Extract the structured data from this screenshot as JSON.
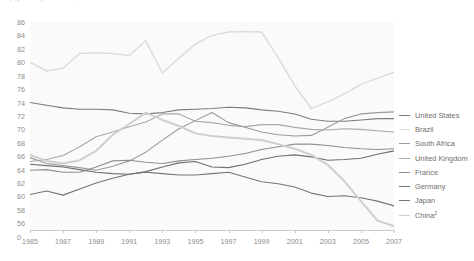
{
  "title": "Employment/Population ratio, 1985 to 2007",
  "chart_data": {
    "type": "line",
    "title": "Employment/Population ratio, 1985 to 2007",
    "xlabel": "",
    "ylabel": "",
    "x": [
      1985,
      1986,
      1987,
      1988,
      1989,
      1990,
      1991,
      1992,
      1993,
      1994,
      1995,
      1996,
      1997,
      1998,
      1999,
      2000,
      2001,
      2002,
      2003,
      2004,
      2005,
      2006,
      2007
    ],
    "xtick_labels": [
      "1985",
      "1987",
      "1989",
      "1991",
      "1993",
      "1995",
      "1997",
      "1999",
      "2001",
      "2003",
      "2005",
      "2007"
    ],
    "ytick_labels": [
      "86",
      "84",
      "82",
      "80",
      "78",
      "76",
      "74",
      "72",
      "70",
      "68",
      "66",
      "64",
      "62",
      "60",
      "58",
      "56"
    ],
    "axis_break_label": "0",
    "ylim": [
      55,
      86
    ],
    "xlim": [
      1985,
      2007
    ],
    "grid": false,
    "legend_position": "right",
    "series": [
      {
        "name": "United States",
        "color": "#7d7d7d",
        "width": 1.1,
        "values": [
          74.0,
          73.6,
          73.2,
          73.0,
          73.0,
          72.9,
          72.4,
          72.3,
          72.5,
          72.9,
          73.0,
          73.1,
          73.3,
          73.2,
          72.9,
          72.7,
          72.3,
          71.5,
          71.2,
          71.2,
          71.4,
          71.6,
          71.6
        ]
      },
      {
        "name": "Brazil",
        "color": "#dcdcdc",
        "width": 1.5,
        "values": [
          80.0,
          78.7,
          79.1,
          81.3,
          81.4,
          81.3,
          81.0,
          83.2,
          78.4,
          80.6,
          82.7,
          84.0,
          84.5,
          84.6,
          84.5,
          80.7,
          76.5,
          73.1,
          74.1,
          75.3,
          76.7,
          77.6,
          78.5
        ]
      },
      {
        "name": "South Africa",
        "color": "#9a9a9a",
        "width": 1.1,
        "values": [
          65.8,
          64.9,
          64.6,
          64.3,
          63.9,
          64.5,
          65.3,
          66.6,
          68.4,
          70.1,
          71.3,
          72.5,
          71.0,
          70.3,
          69.6,
          69.2,
          69.0,
          69.1,
          70.3,
          71.6,
          72.3,
          72.5,
          72.6
        ]
      },
      {
        "name": "United Kingdom",
        "color": "#a8a8a8",
        "width": 1.1,
        "values": [
          65.2,
          65.5,
          66.1,
          67.4,
          68.9,
          69.6,
          70.4,
          71.1,
          72.3,
          72.3,
          71.2,
          71.0,
          70.6,
          70.4,
          70.7,
          70.7,
          70.3,
          70.0,
          69.9,
          70.1,
          70.0,
          69.8,
          69.6
        ]
      },
      {
        "name": "France",
        "color": "#8f8f8f",
        "width": 1.1,
        "values": [
          63.9,
          64.0,
          63.6,
          63.6,
          64.4,
          65.3,
          65.4,
          65.1,
          64.9,
          65.3,
          65.5,
          65.7,
          66.0,
          66.4,
          67.0,
          67.4,
          67.8,
          67.8,
          67.6,
          67.3,
          67.1,
          67.0,
          67.1
        ]
      },
      {
        "name": "Germany",
        "color": "#6f6f6f",
        "width": 1.1,
        "values": [
          64.8,
          64.6,
          64.4,
          64.0,
          63.6,
          63.4,
          63.3,
          63.7,
          64.4,
          65.0,
          65.2,
          64.4,
          64.3,
          64.8,
          65.5,
          66.0,
          66.2,
          65.9,
          65.4,
          65.5,
          65.7,
          66.3,
          66.8
        ]
      },
      {
        "name": "Japan",
        "color": "#757575",
        "width": 1.1,
        "values": [
          60.3,
          60.8,
          60.2,
          61.1,
          62.0,
          62.7,
          63.3,
          63.6,
          63.4,
          63.2,
          63.2,
          63.4,
          63.6,
          62.9,
          62.2,
          61.9,
          61.4,
          60.5,
          60.0,
          60.1,
          59.8,
          59.3,
          58.6
        ]
      },
      {
        "name": "China",
        "color": "#cfcfcf",
        "width": 2.0,
        "values": [
          66.2,
          65.3,
          64.9,
          65.4,
          66.8,
          69.2,
          70.8,
          72.5,
          71.4,
          70.5,
          69.4,
          69.0,
          68.8,
          68.6,
          68.4,
          67.8,
          67.1,
          66.2,
          64.7,
          62.3,
          59.3,
          56.4,
          55.6
        ]
      }
    ]
  },
  "legend": {
    "items": [
      {
        "label": "United States",
        "color": "#7d7d7d"
      },
      {
        "label": "Brazil",
        "color": "#dcdcdc"
      },
      {
        "label": "South Africa",
        "color": "#9a9a9a"
      },
      {
        "label": "United Kingdom",
        "color": "#a8a8a8"
      },
      {
        "label": "France",
        "color": "#8f8f8f"
      },
      {
        "label": "Germany",
        "color": "#6f6f6f"
      },
      {
        "label": "Japan",
        "color": "#757575"
      },
      {
        "label": "China",
        "color": "#cfcfcf",
        "superscript": "2"
      }
    ]
  }
}
